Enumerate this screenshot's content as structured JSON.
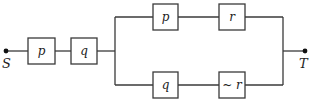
{
  "diagram": {
    "type": "switching-circuit",
    "terminals": {
      "start": "S",
      "end": "T"
    },
    "series_switches": [
      {
        "label": "p"
      },
      {
        "label": "q"
      }
    ],
    "parallel_branches": [
      {
        "switches": [
          {
            "label": "p"
          },
          {
            "label": "r"
          }
        ]
      },
      {
        "switches": [
          {
            "label": "q"
          },
          {
            "label": "~ r"
          }
        ]
      }
    ],
    "colors": {
      "line": "#3a3a3a",
      "background": "#ffffff"
    }
  }
}
